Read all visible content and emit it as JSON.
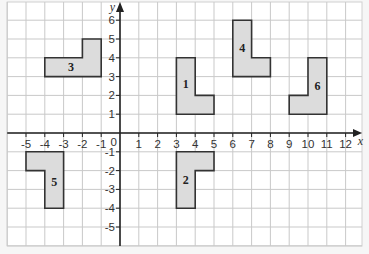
{
  "diagram": {
    "type": "coordinate-grid",
    "axes": {
      "x_label": "x",
      "y_label": "y",
      "x_ticks": [
        "-5",
        "-4",
        "-3",
        "-2",
        "-1",
        "1",
        "2",
        "3",
        "4",
        "5",
        "6",
        "7",
        "8",
        "9",
        "10",
        "11",
        "12"
      ],
      "x_tick_values": [
        -5,
        -4,
        -3,
        -2,
        -1,
        1,
        2,
        3,
        4,
        5,
        6,
        7,
        8,
        9,
        10,
        11,
        12
      ],
      "y_ticks": [
        "6",
        "5",
        "4",
        "3",
        "2",
        "1",
        "-1",
        "-2",
        "-3",
        "-4",
        "-5"
      ],
      "y_tick_values": [
        6,
        5,
        4,
        3,
        2,
        1,
        -1,
        -2,
        -3,
        -4,
        -5
      ],
      "origin_label": "0",
      "x_range": [
        -6,
        12.7
      ],
      "y_range": [
        -5.9,
        6.9
      ]
    },
    "shapes": [
      {
        "label": "1",
        "points": [
          [
            3,
            1
          ],
          [
            5,
            1
          ],
          [
            5,
            2
          ],
          [
            4,
            2
          ],
          [
            4,
            4
          ],
          [
            3,
            4
          ]
        ],
        "label_pos": [
          3.5,
          2.6
        ]
      },
      {
        "label": "2",
        "points": [
          [
            3,
            -1
          ],
          [
            5,
            -1
          ],
          [
            5,
            -2
          ],
          [
            4,
            -2
          ],
          [
            4,
            -4
          ],
          [
            3,
            -4
          ]
        ],
        "label_pos": [
          3.5,
          -2.5
        ]
      },
      {
        "label": "3",
        "points": [
          [
            -4,
            3
          ],
          [
            -1,
            3
          ],
          [
            -1,
            5
          ],
          [
            -2,
            5
          ],
          [
            -2,
            4
          ],
          [
            -4,
            4
          ]
        ],
        "label_pos": [
          -2.6,
          3.5
        ]
      },
      {
        "label": "4",
        "points": [
          [
            6,
            3
          ],
          [
            8,
            3
          ],
          [
            8,
            4
          ],
          [
            7,
            4
          ],
          [
            7,
            6
          ],
          [
            6,
            6
          ]
        ],
        "label_pos": [
          6.5,
          4.5
        ]
      },
      {
        "label": "5",
        "points": [
          [
            -5,
            -1
          ],
          [
            -3,
            -1
          ],
          [
            -3,
            -4
          ],
          [
            -4,
            -4
          ],
          [
            -4,
            -2
          ],
          [
            -5,
            -2
          ]
        ],
        "label_pos": [
          -3.5,
          -2.6
        ]
      },
      {
        "label": "6",
        "points": [
          [
            9,
            1
          ],
          [
            11,
            1
          ],
          [
            11,
            4
          ],
          [
            10,
            4
          ],
          [
            10,
            2
          ],
          [
            9,
            2
          ]
        ],
        "label_pos": [
          10.5,
          2.5
        ]
      }
    ],
    "colors": {
      "shape_fill": "#dcdcdc",
      "shape_stroke": "#333333",
      "grid": "#c9c9c9",
      "axis": "#222222",
      "background": "#f6f6f6"
    }
  }
}
